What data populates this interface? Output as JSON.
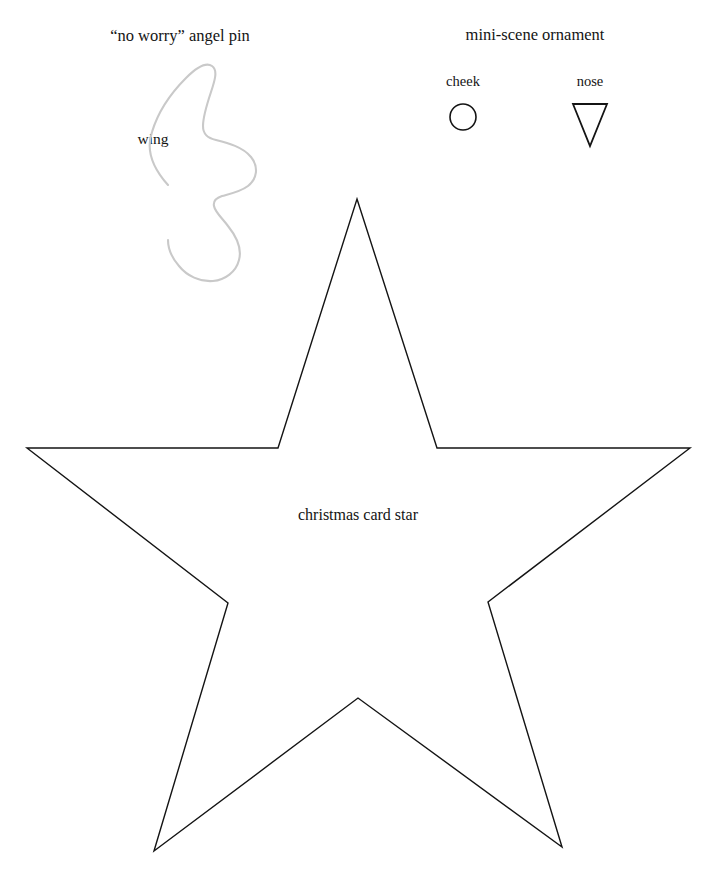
{
  "page": {
    "background_color": "#ffffff",
    "ink_color": "#141414",
    "wing_stroke_color": "#c9c9c9",
    "width": 718,
    "height": 875
  },
  "sections": {
    "angel_pin": {
      "title": "“no worry” angel pin",
      "parts": [
        {
          "label": "wing",
          "shape": "wing-outline"
        }
      ]
    },
    "mini_scene": {
      "title": "mini-scene ornament",
      "parts": [
        {
          "label": "cheek",
          "shape": "circle"
        },
        {
          "label": "nose",
          "shape": "triangle-down"
        }
      ]
    },
    "star": {
      "label": "christmas card star",
      "shape": "five-point-star"
    }
  },
  "shapes": {
    "cheek_circle": {
      "center_x": 463,
      "center_y": 117,
      "radius": 13,
      "stroke_width": 1.6
    },
    "nose_triangle": {
      "points": "573,104 607,104 590,146",
      "stroke_width": 1.8
    },
    "star_polygon": {
      "points": "357,199 437,448 690,448 488,602 562,847 358,698 154,851 228,603 27,448 278,448",
      "stroke_width": 1.4
    },
    "wing_path": {
      "d": "M168,185 C151,166 146,149 152,132 C158,112 172,92 186,78 C196,68 206,62 212,66 C218,70 215,80 211,92 C207,104 203,116 203,126 C203,134 207,138 216,140 C228,143 243,147 251,157 C259,167 257,179 248,186 C240,192 229,194 222,196 C216,198 213,201 214,206 C215,212 222,218 228,226 C236,236 242,249 239,260 C236,272 225,280 213,281 C200,282 187,276 179,266 C172,258 168,248 168,240",
      "stroke_width": 2.1
    }
  }
}
